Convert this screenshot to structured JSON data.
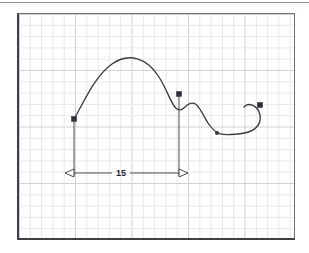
{
  "document": {
    "title": "CAD Spline Dimension View",
    "canvas_width": 309,
    "canvas_height": 253
  },
  "colors": {
    "background": "#ffffff",
    "frame_border_dark": "#3f3f47",
    "frame_border_light": "#6f6f78",
    "grid_minor": "#e8e8ec",
    "grid_major": "#d0d0d6",
    "curve": "#3a3a42",
    "node": "#2b2b33",
    "dimension": "#4a4a53",
    "dimension_text": "#24242b",
    "top_rule": "#8e8e96"
  },
  "frame": {
    "x": 17,
    "y": 13,
    "width": 278,
    "height": 227
  },
  "grid": {
    "minor_spacing": 11.3,
    "major_every": 5,
    "minor_color": "#e8e8ec",
    "major_color": "#d0d0d6",
    "visible": true
  },
  "geometry": {
    "spline": {
      "name": "spline-curve",
      "path": "M 55,105 C 66,86 76,62 93,50 C 110,38 128,44 140,63 C 152,82 155,104 166,93 C 177,82 181,96 189,109 C 198,123 206,121 219,120 C 233,119 243,113 241,101 C 239,91 229,88 225,93",
      "stroke_width": 1.35
    },
    "nodes": [
      {
        "name": "node-start",
        "type": "square",
        "x": 55,
        "y": 105,
        "size": 5
      },
      {
        "name": "node-control-descending",
        "type": "square",
        "x": 160,
        "y": 80,
        "size": 5
      },
      {
        "name": "node-valley",
        "type": "dot",
        "x": 198,
        "y": 119,
        "radius": 2
      },
      {
        "name": "node-end",
        "type": "square",
        "x": 241,
        "y": 91,
        "size": 5
      }
    ]
  },
  "dimension": {
    "name": "linear-dimension-15",
    "label": "15",
    "value": 15,
    "extension_left_x": 55,
    "extension_right_x": 160,
    "extension_top_left_y": 105,
    "extension_top_right_y": 80,
    "dimension_line_y": 159,
    "text_x": 102,
    "text_gap_half": 9,
    "arrow_length": 9,
    "arrow_half_height": 4,
    "arrow_direction": "outward"
  }
}
